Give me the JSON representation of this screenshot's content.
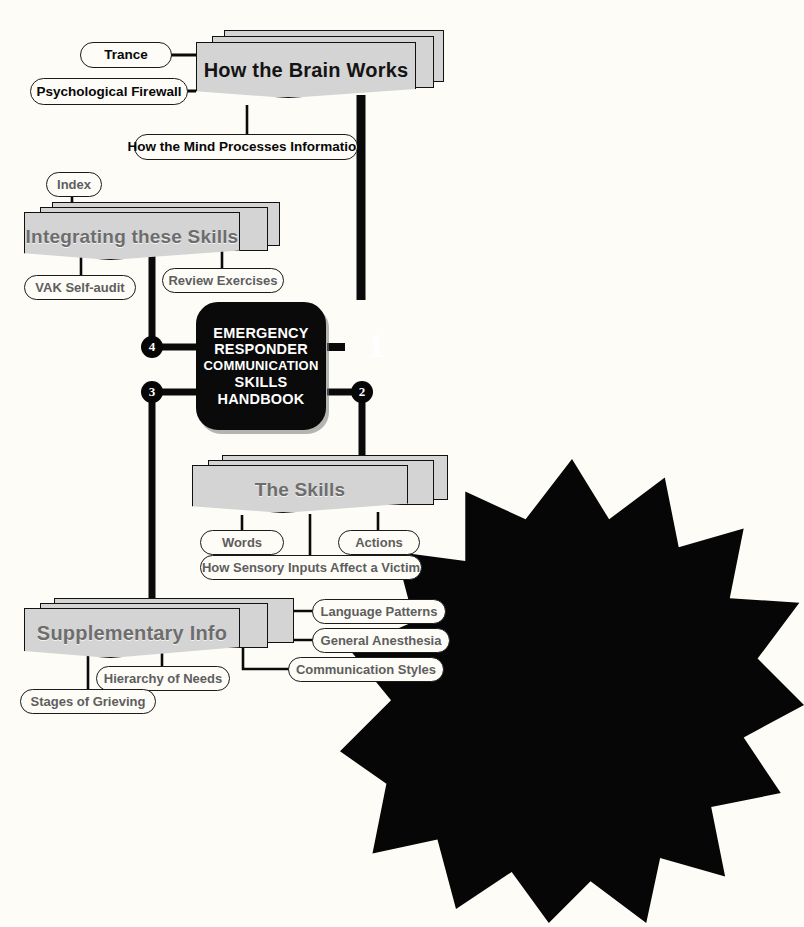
{
  "diagram": {
    "background_color": "#fdfcf7",
    "branch_fill": "#d4d4d4",
    "branch_text_color": "#6d6d6d",
    "hub_fill": "#0a0a0a",
    "line_color": "#0a0a0a"
  },
  "hub": {
    "name": "center-topic",
    "lines": [
      "EMERGENCY",
      "RESPONDER",
      "COMMUNICATION",
      "SKILLS",
      "HANDBOOK"
    ]
  },
  "markers": [
    {
      "id": "m1",
      "label": "1",
      "shape": "starburst"
    },
    {
      "id": "m2",
      "label": "2",
      "shape": "circle"
    },
    {
      "id": "m3",
      "label": "3",
      "shape": "circle"
    },
    {
      "id": "m4",
      "label": "4",
      "shape": "circle"
    }
  ],
  "branches": [
    {
      "id": "brain",
      "marker": "1",
      "label": "How the Brain Works",
      "style": "dark",
      "font_size": 20,
      "children": [
        {
          "label": "Trance",
          "style": "bold"
        },
        {
          "label": "Psychological Firewall",
          "style": "bold"
        },
        {
          "label": "How the Mind Processes Information",
          "style": "bold"
        }
      ]
    },
    {
      "id": "skills",
      "marker": "2",
      "label": "The Skills",
      "style": "grey",
      "font_size": 19,
      "children": [
        {
          "label": "Words",
          "style": "grey"
        },
        {
          "label": "Actions",
          "style": "grey"
        },
        {
          "label": "How Sensory Inputs Affect a Victim",
          "style": "grey"
        }
      ]
    },
    {
      "id": "supplementary",
      "marker": "3",
      "label": "Supplementary Info",
      "style": "grey",
      "font_size": 20,
      "children": [
        {
          "label": "Language Patterns",
          "style": "grey"
        },
        {
          "label": "General Anesthesia",
          "style": "grey"
        },
        {
          "label": "Communication Styles",
          "style": "grey"
        },
        {
          "label": "Hierarchy of Needs",
          "style": "grey"
        },
        {
          "label": "Stages of Grieving",
          "style": "grey"
        }
      ]
    },
    {
      "id": "integrating",
      "marker": "4",
      "label": "Integrating these Skills",
      "style": "grey",
      "font_size": 19,
      "children": [
        {
          "label": "Index",
          "style": "grey"
        },
        {
          "label": "VAK Self-audit",
          "style": "grey"
        },
        {
          "label": "Review Exercises",
          "style": "grey"
        }
      ]
    }
  ]
}
